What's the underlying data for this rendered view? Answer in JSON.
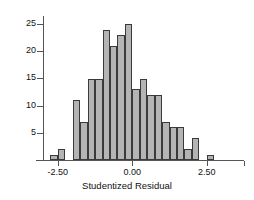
{
  "chart_data": {
    "type": "bar",
    "subtype": "histogram",
    "title": "",
    "xlabel": "Studentized Residual",
    "ylabel": "",
    "xlim": [
      -3.0,
      3.75
    ],
    "ylim": [
      0,
      26.5
    ],
    "grid": false,
    "legend": null,
    "bin_width": 0.25,
    "bar_color": "#b4b4b4",
    "bar_edge_color": "#3a3a3a",
    "axis_color": "#555555",
    "background": "#ffffff",
    "xticks": [
      -2.5,
      0.0,
      2.5,
      3.75
    ],
    "xtick_labels": [
      "-2.50",
      "0.00",
      "2.50",
      ""
    ],
    "yticks": [
      5,
      10,
      15,
      20,
      25
    ],
    "ytick_labels": [
      "5",
      "10",
      "15",
      "20",
      "25"
    ],
    "bin_centers": [
      -2.625,
      -2.375,
      -2.125,
      -1.875,
      -1.625,
      -1.375,
      -1.125,
      -0.875,
      -0.625,
      -0.375,
      -0.125,
      0.125,
      0.375,
      0.625,
      0.875,
      1.125,
      1.375,
      1.625,
      1.875,
      2.125,
      2.375,
      2.625,
      2.875
    ],
    "categories": [
      "-2.625",
      "-2.375",
      "-2.125",
      "-1.875",
      "-1.625",
      "-1.375",
      "-1.125",
      "-0.875",
      "-0.625",
      "-0.375",
      "-0.125",
      "0.125",
      "0.375",
      "0.625",
      "0.875",
      "1.125",
      "1.375",
      "1.625",
      "1.875",
      "2.125",
      "2.375",
      "2.625",
      "2.875"
    ],
    "values": [
      1,
      2,
      0,
      11,
      7,
      15,
      15,
      24,
      21,
      23,
      25,
      13,
      15,
      12,
      12,
      7,
      6,
      6,
      2,
      4,
      0,
      1,
      0
    ]
  }
}
